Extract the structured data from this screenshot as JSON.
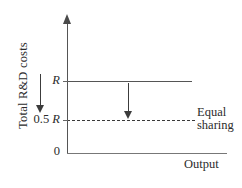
{
  "figure": {
    "title": "",
    "axes": {
      "y_label": "Total R&D costs",
      "x_label": "Output",
      "origin_label": "0"
    },
    "ticks": {
      "r_label": "R",
      "half_r_number": "0.5",
      "half_r_symbol": "R"
    },
    "legend": {
      "line1": "Equal",
      "line2": "sharing"
    },
    "icons": {
      "y_axis_arrow": "arrow-up-icon",
      "cost_reduction_arrow_left": "arrow-down-icon",
      "cost_reduction_arrow_mid": "arrow-down-icon"
    }
  },
  "chart_data": {
    "type": "line",
    "title": "",
    "xlabel": "Output",
    "ylabel": "Total R&D costs",
    "xlim": [
      0,
      1
    ],
    "ylim": [
      0,
      1.35
    ],
    "grid": false,
    "legend_position": "right",
    "y_tick_values": [
      0,
      0.5,
      1
    ],
    "y_tick_labels": [
      "0",
      "0.5 R",
      "R"
    ],
    "x_tick_values": [],
    "x_tick_labels": [],
    "series": [
      {
        "name": "R",
        "style": "solid",
        "color": "#555555",
        "x": [
          0,
          0.78
        ],
        "values": [
          1,
          1
        ]
      },
      {
        "name": "Equal sharing",
        "style": "dashed",
        "color": "#3a3a3a",
        "x": [
          0,
          0.8
        ],
        "values": [
          0.5,
          0.5
        ]
      }
    ],
    "annotations": [
      {
        "type": "arrow",
        "direction": "down",
        "x": 0.36,
        "y_from": 1,
        "y_to": 0.5,
        "label": ""
      },
      {
        "type": "arrow",
        "direction": "down",
        "x": -0.19,
        "y_from": 1.05,
        "y_to": 0.55,
        "label": ""
      }
    ]
  }
}
